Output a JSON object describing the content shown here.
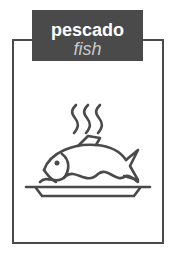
{
  "card": {
    "label_spanish": "pescado",
    "label_english": "fish",
    "icon": "cooked-fish-on-plate-icon",
    "colors": {
      "frame": "#4a4a4a",
      "label_background": "#4a4a4a",
      "label_spanish_text": "#ffffff",
      "label_english_text": "#c8c8c8",
      "icon_stroke": "#4a4a4a"
    }
  }
}
